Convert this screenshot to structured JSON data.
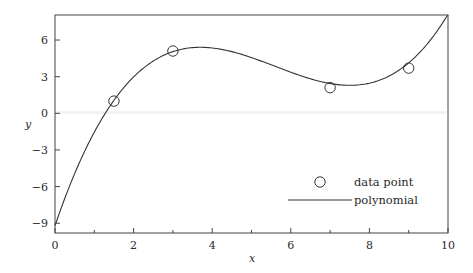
{
  "chart_data": {
    "type": "scatter+line",
    "title": "",
    "xlabel": "x",
    "ylabel": "y",
    "xlim": [
      0,
      10
    ],
    "ylim": [
      -9.8,
      8.05
    ],
    "xticks": [
      0,
      2,
      4,
      6,
      8,
      10
    ],
    "xtick_labels": [
      "0",
      "2",
      "4",
      "6",
      "8",
      "10"
    ],
    "xminor_ticks": [
      1,
      3,
      5,
      7,
      9
    ],
    "yticks": [
      6,
      3,
      0,
      -3,
      -6,
      -9
    ],
    "ytick_labels": [
      "6",
      "3",
      "0",
      "−3",
      "−6",
      "−9"
    ],
    "grid": false,
    "legend_position": "lower right",
    "series": [
      {
        "name": "data point",
        "type": "scatter",
        "marker": "open-circle",
        "x": [
          1.5,
          3,
          7,
          9
        ],
        "y": [
          1.0,
          5.1,
          2.1,
          3.7
        ]
      },
      {
        "name": "polynomial",
        "type": "line",
        "description": "cubic fit, local max near (3.7, 5.4), local min near (7.5, 2.0)",
        "coefficients_cubic": {
          "a": 0.1135,
          "b": -1.9068,
          "c": 9.4489,
          "d": -9.2
        },
        "x": [
          0,
          1,
          1.5,
          2,
          3,
          3.7,
          4,
          5,
          6,
          7,
          7.5,
          8,
          9,
          10
        ],
        "y": [
          -9.2,
          -1.1,
          1.07,
          2.78,
          5.05,
          5.4,
          5.35,
          4.47,
          3.29,
          2.44,
          2.29,
          2.38,
          4.13,
          8.1
        ]
      }
    ]
  },
  "legend": {
    "items": [
      {
        "label": "data point",
        "symbol": "open-circle"
      },
      {
        "label": "polynomial",
        "symbol": "line"
      }
    ]
  },
  "axes": {
    "x_label": "x",
    "y_label": "y"
  },
  "colors": {
    "line": "#333333",
    "axes": "#444444",
    "text": "#2a2a2a",
    "background": "#ffffff"
  }
}
